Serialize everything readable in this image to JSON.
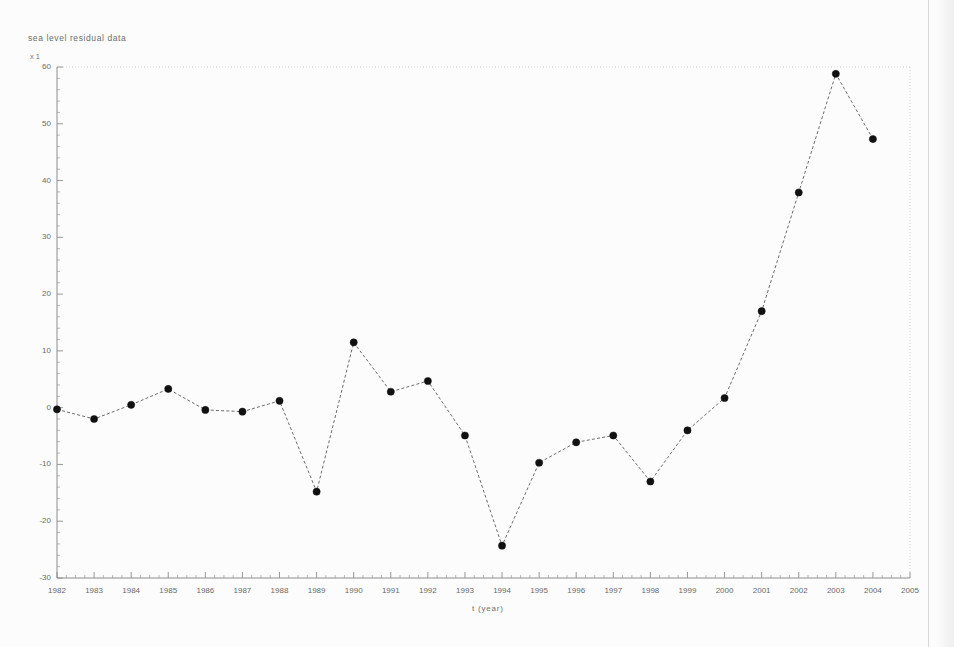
{
  "figure": {
    "title": "sea level residual data",
    "y_axis_unit": "x 1",
    "x_axis_title": "t (year)",
    "caption": ""
  },
  "colors": {
    "background": "#fcfcfc",
    "axis": "#8d8d8d",
    "grid": "#c9c9c9",
    "marker": "#111111",
    "line": "#5a5a5a",
    "text": "#6a6a6a"
  },
  "chart_data": {
    "type": "line",
    "title": "sea level residual data",
    "xlabel": "t (year)",
    "ylabel": "",
    "xlim": [
      1982,
      2005
    ],
    "ylim": [
      -30,
      60
    ],
    "grid": false,
    "legend": "none",
    "marker": "filled-circle",
    "linestyle": "dashed",
    "x_tick_labels": [
      "1982",
      "1983",
      "1984",
      "1985",
      "1986",
      "1987",
      "1988",
      "1989",
      "1990",
      "1991",
      "1992",
      "1993",
      "1994",
      "1995",
      "1996",
      "1997",
      "1998",
      "1999",
      "2000",
      "2001",
      "2002",
      "2003",
      "2004",
      "2005"
    ],
    "y_tick_labels": [
      "60",
      "50",
      "40",
      "30",
      "20",
      "10",
      "0",
      "-10",
      "-20",
      "-30"
    ],
    "y_ticks": [
      60,
      50,
      40,
      30,
      20,
      10,
      0,
      -10,
      -20,
      -30
    ],
    "x": [
      1982,
      1983,
      1984,
      1985,
      1986,
      1987,
      1988,
      1989,
      1990,
      1991,
      1992,
      1993,
      1994,
      1995,
      1996,
      1997,
      1998,
      1999,
      2000,
      2001,
      2002,
      2003,
      2004
    ],
    "values": [
      -0.3,
      -2.0,
      0.5,
      3.3,
      -0.4,
      -0.7,
      1.2,
      -14.8,
      11.5,
      2.8,
      4.7,
      -4.9,
      -24.3,
      -9.7,
      -6.1,
      -4.9,
      -13.0,
      -4.0,
      1.7,
      17.0,
      37.9,
      58.8,
      47.3
    ],
    "series": [
      {
        "name": "sea level residual",
        "values": [
          -0.3,
          -2.0,
          0.5,
          3.3,
          -0.4,
          -0.7,
          1.2,
          -14.8,
          11.5,
          2.8,
          4.7,
          -4.9,
          -24.3,
          -9.7,
          -6.1,
          -4.9,
          -13.0,
          -4.0,
          1.7,
          17.0,
          37.9,
          58.8,
          47.3
        ]
      }
    ]
  }
}
